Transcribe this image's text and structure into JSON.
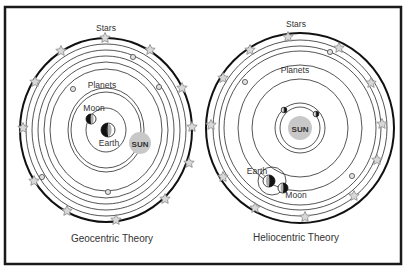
{
  "figure": {
    "frame": {
      "x": 5,
      "y": 7,
      "width": 396,
      "height": 257,
      "stroke": "#1a1a1a"
    },
    "colors": {
      "ring": "#2a2a2a",
      "outer_ring": "#111111",
      "star_fill": "#d8d8d8",
      "star_stroke": "#888888",
      "sun_fill": "#c8c8c8",
      "text": "#333333",
      "planet_fill": "#e0e0e0"
    }
  },
  "geocentric": {
    "caption": "Geocentric Theory",
    "labels": {
      "stars": "Stars",
      "planets": "Planets",
      "moon": "Moon",
      "earth": "Earth",
      "sun": "SUN"
    },
    "center": [
      106,
      130
    ],
    "outer": {
      "rx": 86,
      "ry": 92
    },
    "rings": [
      [
        80,
        86
      ],
      [
        74,
        80
      ],
      [
        68,
        74
      ],
      [
        62,
        68
      ],
      [
        56,
        61
      ],
      [
        38,
        42
      ],
      [
        20,
        22
      ]
    ],
    "sun_orbit": {
      "rx": 35,
      "ry": 38
    },
    "earth": [
      108,
      130,
      7
    ],
    "moon": [
      91,
      119,
      5
    ],
    "sun": [
      140,
      143,
      11
    ],
    "stars": [
      [
        105,
        38
      ],
      [
        61,
        51
      ],
      [
        150,
        50
      ],
      [
        35,
        82
      ],
      [
        182,
        88
      ],
      [
        23,
        128
      ],
      [
        192,
        127
      ],
      [
        34,
        181
      ],
      [
        189,
        163
      ],
      [
        67,
        211
      ],
      [
        165,
        199
      ],
      [
        116,
        220
      ]
    ],
    "planets": [
      [
        133,
        57
      ],
      [
        73,
        89
      ],
      [
        159,
        87
      ],
      [
        42,
        177
      ],
      [
        108,
        192
      ]
    ]
  },
  "heliocentric": {
    "caption": "Heliocentric Theory",
    "labels": {
      "stars": "Stars",
      "planets": "Planets",
      "moon": "Moon",
      "earth": "Earth",
      "sun": "SUN"
    },
    "center": [
      300,
      128
    ],
    "outer": {
      "rx": 94,
      "ry": 95
    },
    "rings": [
      [
        87,
        88
      ],
      [
        81,
        82
      ],
      [
        76,
        77
      ],
      [
        62,
        63
      ],
      [
        48,
        49
      ],
      [
        25,
        25
      ],
      [
        20,
        21
      ]
    ],
    "earth": [
      269,
      181,
      6
    ],
    "earth_orbit": [
      272,
      181,
      14
    ],
    "moon": [
      283,
      188,
      5
    ],
    "sun": [
      300,
      128,
      12
    ],
    "stars": [
      [
        288,
        37
      ],
      [
        250,
        50
      ],
      [
        339,
        48
      ],
      [
        223,
        78
      ],
      [
        371,
        83
      ],
      [
        211,
        125
      ],
      [
        382,
        124
      ],
      [
        223,
        177
      ],
      [
        377,
        160
      ],
      [
        255,
        208
      ],
      [
        354,
        196
      ],
      [
        305,
        217
      ]
    ],
    "planets": [
      [
        330,
        52
      ],
      [
        245,
        82
      ],
      [
        352,
        176
      ]
    ],
    "inner_planets": [
      [
        284,
        110
      ],
      [
        316,
        114
      ]
    ]
  }
}
